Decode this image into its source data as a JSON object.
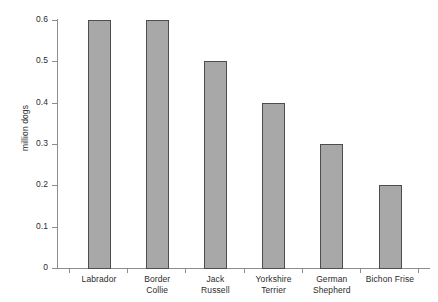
{
  "chart_data": {
    "type": "bar",
    "title": "",
    "xlabel": "",
    "ylabel": "million dogs",
    "categories": [
      "Labrador",
      "Border Collie",
      "Jack Russell",
      "Yorkshire Terrier",
      "German Shepherd",
      "Bichon Frise"
    ],
    "category_lines": [
      [
        "Labrador"
      ],
      [
        "Border",
        "Collie"
      ],
      [
        "Jack",
        "Russell"
      ],
      [
        "Yorkshire",
        "Terrier"
      ],
      [
        "German",
        "Shepherd"
      ],
      [
        "Bichon Frise"
      ]
    ],
    "values": [
      0.6,
      0.6,
      0.5,
      0.4,
      0.3,
      0.2
    ],
    "ylim": [
      0,
      0.6
    ],
    "ytick_values": [
      0,
      0.1,
      0.2,
      0.3,
      0.4,
      0.5,
      0.6
    ],
    "ytick_labels": [
      "0",
      "0.1",
      "0.2",
      "0.3",
      "0.4",
      "0.5",
      "0.6"
    ],
    "grid": false,
    "legend": null,
    "bar_color": "#a8a8a8",
    "bar_edge_color": "#4d4d4d",
    "axis_color": "#8c8c8c",
    "text_color": "#2b2b2b",
    "background": "#ffffff"
  }
}
